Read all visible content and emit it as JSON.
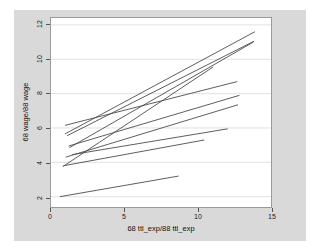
{
  "chart_data": {
    "type": "line",
    "title": "",
    "subtitle": "",
    "xlabel": "68 ttl_exp/88 ttl_exp",
    "ylabel": "68 wage/88 wage",
    "xlim": [
      0,
      15
    ],
    "ylim": [
      1.4,
      12.4
    ],
    "xticks": [
      0,
      5,
      10,
      15
    ],
    "xtick_labels": [
      "0",
      "5",
      "10",
      "15"
    ],
    "yticks": [
      2,
      4,
      6,
      8,
      10,
      12
    ],
    "ytick_labels": [
      "2",
      "4",
      "6",
      "8",
      "10",
      "12"
    ],
    "grid": "horizontal",
    "grid_color": "#e2e2e2",
    "legend": "none",
    "line_color": "#4a4a4a",
    "background": "#d9d9d9",
    "plot_background": "#ffffff",
    "series": [
      {
        "name": "line-1",
        "x": [
          0.95,
          13.9
        ],
        "y": [
          5.65,
          11.6
        ]
      },
      {
        "name": "line-2",
        "x": [
          1.25,
          13.8
        ],
        "y": [
          4.85,
          11.0
        ]
      },
      {
        "name": "line-3",
        "x": [
          0.8,
          11.05
        ],
        "y": [
          3.75,
          9.55
        ]
      },
      {
        "name": "line-4",
        "x": [
          0.95,
          12.7
        ],
        "y": [
          6.15,
          8.7
        ]
      },
      {
        "name": "line-5",
        "x": [
          1.2,
          12.85
        ],
        "y": [
          4.95,
          7.9
        ]
      },
      {
        "name": "line-6",
        "x": [
          1.0,
          12.75
        ],
        "y": [
          4.3,
          7.35
        ]
      },
      {
        "name": "line-7",
        "x": [
          1.45,
          12.05
        ],
        "y": [
          4.45,
          5.95
        ]
      },
      {
        "name": "line-8",
        "x": [
          0.85,
          10.45
        ],
        "y": [
          3.8,
          5.3
        ]
      },
      {
        "name": "line-9",
        "x": [
          0.6,
          8.7
        ],
        "y": [
          2.0,
          3.2
        ]
      },
      {
        "name": "line-10",
        "x": [
          1.1,
          13.85
        ],
        "y": [
          5.55,
          11.05
        ]
      }
    ]
  },
  "figure": {
    "caption": ""
  }
}
